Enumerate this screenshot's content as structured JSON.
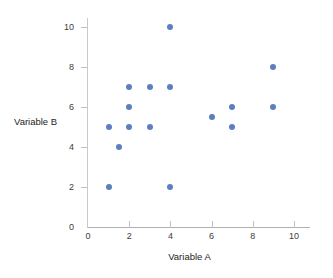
{
  "chart_data": {
    "type": "scatter",
    "title": "",
    "xlabel": "Variable A",
    "ylabel": "Variable B",
    "xlim": [
      0,
      11
    ],
    "ylim": [
      0,
      10.6
    ],
    "xticks": [
      0,
      2,
      4,
      6,
      8,
      10
    ],
    "xtick_labels": [
      "0",
      "2",
      "4",
      "6",
      "8",
      "10"
    ],
    "yticks": [
      2,
      4,
      6,
      8,
      10
    ],
    "ytick_labels": [
      "2",
      "4",
      "6",
      "8",
      "10"
    ],
    "y_origin_label": "0",
    "grid": false,
    "legend": null,
    "marker_color": "#5b7fc0",
    "axis_color": "#c0c0c0",
    "points": [
      {
        "x": 1,
        "y": 2
      },
      {
        "x": 1,
        "y": 5
      },
      {
        "x": 1.5,
        "y": 4
      },
      {
        "x": 2,
        "y": 5
      },
      {
        "x": 2,
        "y": 6
      },
      {
        "x": 2,
        "y": 7
      },
      {
        "x": 3,
        "y": 5
      },
      {
        "x": 3,
        "y": 7
      },
      {
        "x": 4,
        "y": 2
      },
      {
        "x": 4,
        "y": 7
      },
      {
        "x": 4,
        "y": 10
      },
      {
        "x": 6,
        "y": 5.5
      },
      {
        "x": 7,
        "y": 5
      },
      {
        "x": 7,
        "y": 6
      },
      {
        "x": 9,
        "y": 6
      },
      {
        "x": 9,
        "y": 8
      }
    ]
  }
}
